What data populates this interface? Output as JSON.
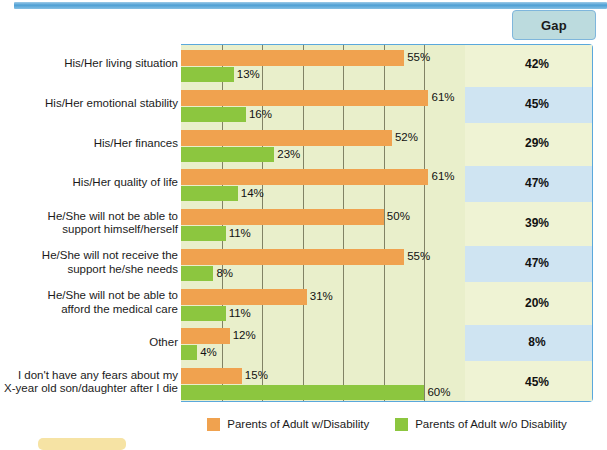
{
  "gap_header": {
    "label": "Gap"
  },
  "legend": {
    "items": [
      {
        "label": "Parents of Adult w/Disability",
        "color": "#f0a24f",
        "swatch": "orange-swatch"
      },
      {
        "label": "Parents of Adult w/o Disability",
        "color": "#8cc63f",
        "swatch": "green-swatch"
      }
    ]
  },
  "colors": {
    "orange": "#f0a24f",
    "green": "#8cc63f",
    "plot_background": "#e9efcb",
    "gap_column_background": "#eff3d4",
    "gap_row_highlight": "#cfe4f2",
    "frame_border": "#5aa8dc",
    "gap_header_background": "#bcdbde"
  },
  "chart_data": {
    "type": "bar",
    "title": "",
    "xlabel": "",
    "ylabel": "",
    "xlim": [
      0,
      70
    ],
    "grid": true,
    "legend_position": "bottom",
    "orientation": "horizontal",
    "categories": [
      "His/Her living situation",
      "His/Her emotional stability",
      "His/Her finances",
      "His/Her quality of life",
      "He/She will not be able to support himself/herself",
      "He/She will not receive the support he/she needs",
      "He/She will not be able to afford the medical care",
      "Other",
      "I don't have any fears about my X-year old son/daughter after I die"
    ],
    "category_lines": [
      [
        "His/Her living situation"
      ],
      [
        "His/Her emotional stability"
      ],
      [
        "His/Her finances"
      ],
      [
        "His/Her quality of life"
      ],
      [
        "He/She will not be able to",
        "support himself/herself"
      ],
      [
        "He/She will not receive the",
        "support he/she needs"
      ],
      [
        "He/She will not be able to",
        "afford the medical care"
      ],
      [
        "Other"
      ],
      [
        "I don't have any fears about my",
        "X-year old son/daughter after I die"
      ]
    ],
    "series": [
      {
        "name": "Parents of Adult w/Disability",
        "color": "#f0a24f",
        "values": [
          55,
          61,
          52,
          61,
          50,
          55,
          31,
          12,
          15
        ],
        "labels": [
          "55%",
          "61%",
          "52%",
          "61%",
          "50%",
          "55%",
          "31%",
          "12%",
          "15%"
        ]
      },
      {
        "name": "Parents of Adult w/o Disability",
        "color": "#8cc63f",
        "values": [
          13,
          16,
          23,
          14,
          11,
          8,
          11,
          4,
          60
        ],
        "labels": [
          "13%",
          "16%",
          "23%",
          "14%",
          "11%",
          "8%",
          "11%",
          "4%",
          "60%"
        ]
      }
    ],
    "gap_column": {
      "header": "Gap",
      "values": [
        42,
        45,
        29,
        47,
        39,
        47,
        20,
        8,
        45
      ],
      "labels": [
        "42%",
        "45%",
        "29%",
        "47%",
        "39%",
        "47%",
        "20%",
        "8%",
        "45%"
      ],
      "highlighted_rows": [
        1,
        3,
        5,
        7
      ]
    },
    "gridline_values": [
      10,
      20,
      30,
      40,
      50,
      60
    ]
  }
}
